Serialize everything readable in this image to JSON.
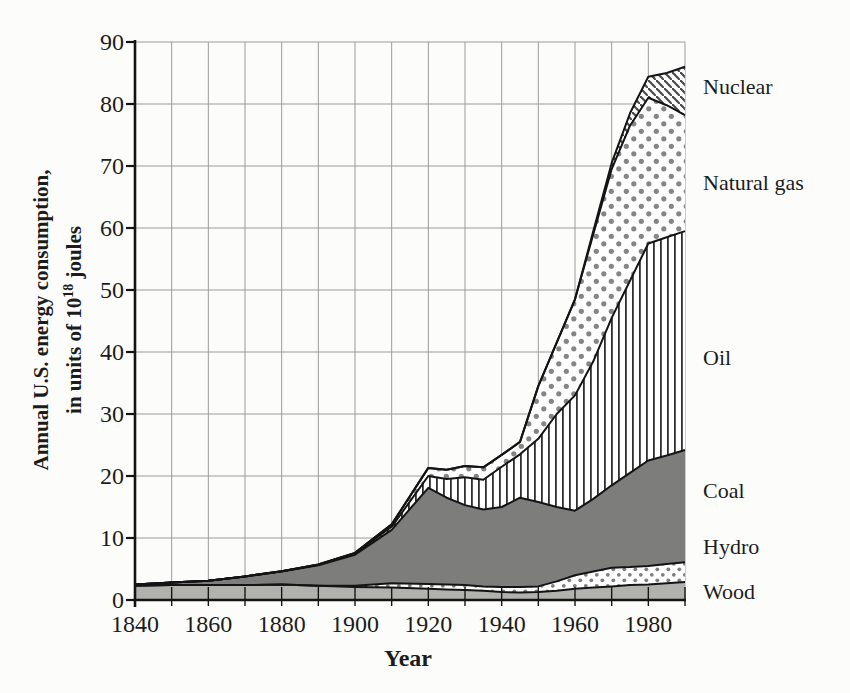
{
  "colors": {
    "wood": "#b1b1ad",
    "coal": "#7d7d7b",
    "dot_gray": "#858585",
    "small_dot_gray": "#7e7e7e",
    "stripe_dark": "#2f2f2f",
    "hatch_gray": "#4a4a4a",
    "line": "#141414",
    "grid": "#9c9c9c",
    "axis": "#141414",
    "text": "#1c1c1c",
    "background": "#fcfcfb"
  },
  "figure": {
    "y_axis": {
      "label_line1": "Annual U.S. energy consumption,",
      "label_line2_prefix": "in units of 10",
      "label_line2_sup": "18",
      "label_line2_suffix": " joules",
      "ticks": [
        0,
        10,
        20,
        30,
        40,
        50,
        60,
        70,
        80,
        90
      ]
    },
    "x_axis": {
      "label": "Year",
      "ticks": [
        1840,
        1860,
        1880,
        1900,
        1920,
        1940,
        1960,
        1980
      ]
    },
    "band_labels": [
      "Nuclear",
      "Natural gas",
      "Oil",
      "Coal",
      "Hydro",
      "Wood"
    ]
  },
  "chart_data": {
    "type": "area",
    "stacked": true,
    "title": "",
    "xlabel": "Year",
    "ylabel": "Annual U.S. energy consumption, in units of 10^18 joules",
    "xlim": [
      1840,
      1990
    ],
    "ylim": [
      0,
      90
    ],
    "grid": true,
    "x": [
      1840,
      1850,
      1860,
      1870,
      1880,
      1890,
      1900,
      1910,
      1920,
      1925,
      1930,
      1935,
      1940,
      1945,
      1950,
      1955,
      1960,
      1965,
      1970,
      1975,
      1980,
      1985,
      1990
    ],
    "series": [
      {
        "name": "Wood",
        "pattern": "solid-light-gray",
        "values": [
          2.3,
          2.4,
          2.4,
          2.4,
          2.5,
          2.3,
          2.1,
          2.0,
          1.8,
          1.7,
          1.6,
          1.5,
          1.3,
          1.2,
          1.3,
          1.5,
          1.8,
          2.0,
          2.2,
          2.4,
          2.5,
          2.7,
          2.9
        ]
      },
      {
        "name": "Hydro",
        "pattern": "small-dots",
        "values": [
          0,
          0,
          0,
          0,
          0,
          0,
          0.2,
          0.7,
          0.8,
          0.8,
          0.8,
          0.7,
          0.8,
          0.9,
          0.9,
          1.5,
          2.2,
          2.6,
          3.0,
          2.9,
          3.0,
          3.1,
          3.2
        ]
      },
      {
        "name": "Coal",
        "pattern": "solid-dark-gray",
        "values": [
          0.2,
          0.4,
          0.7,
          1.4,
          2.1,
          3.3,
          5.0,
          8.6,
          15.5,
          14.0,
          12.9,
          12.4,
          12.9,
          14.4,
          13.6,
          12.0,
          10.4,
          11.7,
          13.3,
          15.2,
          17.0,
          17.5,
          18.1
        ]
      },
      {
        "name": "Oil",
        "pattern": "vertical-stripes",
        "values": [
          0,
          0,
          0,
          0,
          0.05,
          0.1,
          0.2,
          0.5,
          1.9,
          3.0,
          4.5,
          4.8,
          6.5,
          7.0,
          10.2,
          15.0,
          18.6,
          22.2,
          27.0,
          31.0,
          35.0,
          35.2,
          35.3
        ]
      },
      {
        "name": "Natural gas",
        "pattern": "polka-dots",
        "values": [
          0,
          0,
          0,
          0,
          0,
          0.05,
          0.1,
          0.4,
          1.3,
          1.5,
          1.8,
          2.0,
          1.9,
          2.0,
          8.5,
          11.5,
          15.5,
          20.5,
          24.0,
          25.0,
          23.5,
          21.3,
          18.7
        ]
      },
      {
        "name": "Nuclear",
        "pattern": "diagonal-hatch",
        "values": [
          0,
          0,
          0,
          0,
          0,
          0,
          0,
          0,
          0,
          0,
          0,
          0,
          0,
          0,
          0,
          0,
          0,
          0.5,
          1.0,
          2.0,
          3.4,
          5.2,
          7.8
        ]
      }
    ]
  }
}
